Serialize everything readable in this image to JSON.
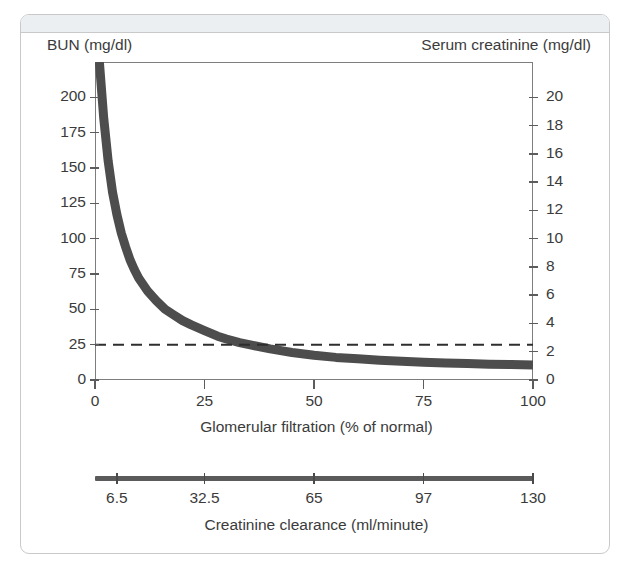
{
  "card": {
    "header_label": ""
  },
  "chart_data": {
    "type": "line",
    "title": "",
    "xlabel": "Glomerular filtration (% of normal)",
    "ylabel": "BUN (mg/dl)",
    "y2label": "Serum creatinine (mg/dl)",
    "secondary_xlabel": "Creatinine clearance (ml/minute)",
    "grid": false,
    "legend": "none",
    "xlim": [
      0,
      100
    ],
    "ylim": [
      0,
      225
    ],
    "y2lim": [
      0,
      22.5
    ],
    "xticks": [
      0,
      25,
      50,
      75,
      100
    ],
    "xticklabels": [
      "0",
      "25",
      "50",
      "75",
      "100"
    ],
    "yticks": [
      0,
      25,
      50,
      75,
      100,
      125,
      150,
      175,
      200
    ],
    "yticklabels": [
      "0",
      "25",
      "50",
      "75",
      "100",
      "125",
      "150",
      "175",
      "200"
    ],
    "y2ticks": [
      0,
      2,
      4,
      6,
      8,
      10,
      12,
      14,
      16,
      18,
      20
    ],
    "y2ticklabels": [
      "0",
      "2",
      "4",
      "6",
      "8",
      "10",
      "12",
      "14",
      "16",
      "18",
      "20"
    ],
    "secondary_xticks": [
      5,
      25,
      50,
      75,
      100
    ],
    "secondary_xticklabels": [
      "6.5",
      "32.5",
      "65",
      "97",
      "130"
    ],
    "series": [
      {
        "name": "BUN / Serum creatinine vs GFR",
        "color": "#4d4d4d",
        "linewidth": 9,
        "x": [
          1,
          2,
          3,
          4,
          5,
          6,
          7,
          8,
          9,
          10,
          12,
          14,
          16,
          18,
          20,
          22,
          25,
          28,
          30,
          33,
          36,
          40,
          45,
          50,
          55,
          60,
          65,
          70,
          75,
          80,
          85,
          90,
          95,
          100
        ],
        "y": [
          225,
          185,
          155,
          133,
          117,
          104,
          94,
          85,
          78,
          72,
          63,
          56,
          50,
          46,
          42,
          39,
          35,
          31,
          29,
          26.5,
          24.5,
          22,
          19.5,
          17.5,
          16,
          15,
          14,
          13.2,
          12.6,
          12.1,
          11.6,
          11.2,
          10.9,
          10.6
        ],
        "y2": [
          22.5,
          18.5,
          15.5,
          13.3,
          11.7,
          10.4,
          9.4,
          8.5,
          7.8,
          7.2,
          6.3,
          5.6,
          5.0,
          4.6,
          4.2,
          3.9,
          3.5,
          3.1,
          2.9,
          2.65,
          2.45,
          2.2,
          1.95,
          1.75,
          1.6,
          1.5,
          1.4,
          1.32,
          1.26,
          1.21,
          1.16,
          1.12,
          1.09,
          1.06
        ]
      }
    ],
    "annotations": [
      {
        "name": "upper-limit-of-normal-line",
        "type": "hline",
        "y": 25,
        "y2": 2.0,
        "style": "dashed",
        "color": "#2e2e2e",
        "label": ""
      }
    ]
  }
}
